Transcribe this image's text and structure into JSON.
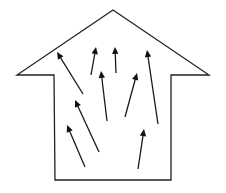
{
  "diagram": {
    "type": "house-shaped upward arrow with internal arrows",
    "background": "#ffffff",
    "stroke_color": "#222222",
    "outline": {
      "shape": "arrow-house",
      "points": [
        [
          113,
          10
        ],
        [
          209,
          75
        ],
        [
          171,
          75
        ],
        [
          171,
          180
        ],
        [
          55,
          180
        ],
        [
          54,
          75
        ],
        [
          17,
          75
        ]
      ]
    },
    "arrows": [
      {
        "id": "arrow-1",
        "from": [
          83,
          94
        ],
        "to": [
          57,
          52
        ]
      },
      {
        "id": "arrow-2",
        "from": [
          91,
          75
        ],
        "to": [
          96,
          47
        ]
      },
      {
        "id": "arrow-3",
        "from": [
          116,
          73
        ],
        "to": [
          115,
          47
        ]
      },
      {
        "id": "arrow-4",
        "from": [
          158,
          124
        ],
        "to": [
          147,
          50
        ]
      },
      {
        "id": "arrow-5",
        "from": [
          107,
          121
        ],
        "to": [
          101,
          71
        ]
      },
      {
        "id": "arrow-6",
        "from": [
          125,
          117
        ],
        "to": [
          137,
          73
        ]
      },
      {
        "id": "arrow-7",
        "from": [
          99,
          152
        ],
        "to": [
          75,
          100
        ]
      },
      {
        "id": "arrow-8",
        "from": [
          85,
          167
        ],
        "to": [
          67,
          125
        ]
      },
      {
        "id": "arrow-9",
        "from": [
          138,
          169
        ],
        "to": [
          144,
          129
        ]
      }
    ],
    "arrowhead": {
      "length": 7,
      "half_width": 3.2
    }
  }
}
